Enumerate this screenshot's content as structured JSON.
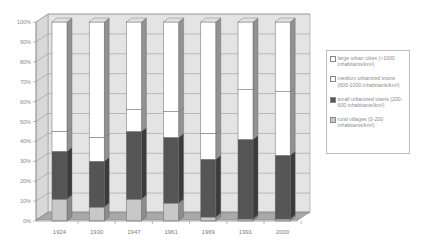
{
  "chart_data": {
    "type": "bar",
    "subtype": "100% stacked 3D column",
    "title": "",
    "xlabel": "",
    "ylabel": "",
    "ylim": [
      0,
      100
    ],
    "y_ticks": [
      "0%",
      "10%",
      "20%",
      "30%",
      "40%",
      "50%",
      "60%",
      "70%",
      "80%",
      "90%",
      "100%"
    ],
    "grid": true,
    "legend_position": "right",
    "categories": [
      "1924",
      "1930",
      "1947",
      "1961",
      "1969",
      "1991",
      "2000"
    ],
    "series": [
      {
        "name": "rural villages (0-200 inhabitants/km²)",
        "color": "#c8c8c8",
        "values": [
          11,
          7,
          11,
          9,
          2,
          1,
          1
        ]
      },
      {
        "name": "small urbanized towns (200-600 inhabitants/km²)",
        "color": "#555555",
        "values": [
          24,
          23,
          34,
          33,
          29,
          40,
          32
        ]
      },
      {
        "name": "medium urbanized towns (600-1000 inhabitants/km²)",
        "color": "#ffffff",
        "values": [
          10,
          12,
          11,
          13,
          13,
          25,
          32
        ]
      },
      {
        "name": "large urban cities (>1000 inhabitants/km²)",
        "color": "#ffffff",
        "values": [
          55,
          58,
          44,
          45,
          56,
          34,
          35
        ]
      }
    ]
  },
  "legend": {
    "items": [
      {
        "label": "large urban cities (>1000 inhabitants/km²)",
        "color": "#ffffff"
      },
      {
        "label": "medium urbanized towns (600-1000 inhabitants/km²)",
        "color": "#ffffff"
      },
      {
        "label": "small urbanized towns (200-600 inhabitants/km²)",
        "color": "#555555"
      },
      {
        "label": "rural villages (0-200 inhabitants/km²)",
        "color": "#c8c8c8"
      }
    ]
  }
}
